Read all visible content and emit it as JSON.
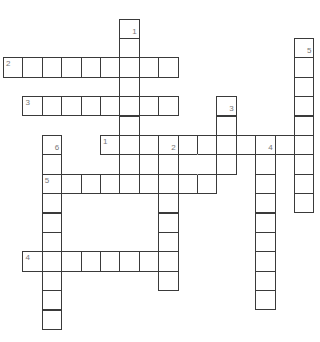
{
  "puzzle": {
    "cell_size": 19.4,
    "origin": {
      "x": 3,
      "y": 18.5
    },
    "colors": {
      "border": "#3a3a3a",
      "background": "#ffffff",
      "number": "#777777"
    },
    "words": [
      {
        "number": "1",
        "direction": "down",
        "col": 6,
        "row": 0,
        "length": 9,
        "label_pos": "br"
      },
      {
        "number": "2",
        "direction": "across",
        "col": 0,
        "row": 2,
        "length": 9,
        "label_pos": "tl"
      },
      {
        "number": "3",
        "direction": "across",
        "col": 1,
        "row": 4,
        "length": 8,
        "label_pos": "tl"
      },
      {
        "number": "3",
        "direction": "down",
        "col": 11,
        "row": 4,
        "length": 4,
        "label_pos": "br"
      },
      {
        "number": "5",
        "direction": "down",
        "col": 15,
        "row": 1,
        "length": 9,
        "label_pos": "br"
      },
      {
        "number": "1",
        "direction": "across",
        "col": 5,
        "row": 6,
        "length": 11,
        "label_pos": "tl"
      },
      {
        "number": "2",
        "direction": "down",
        "col": 8,
        "row": 6,
        "length": 8,
        "label_pos": "br"
      },
      {
        "number": "4",
        "direction": "down",
        "col": 13,
        "row": 6,
        "length": 9,
        "label_pos": "br"
      },
      {
        "number": "6",
        "direction": "down",
        "col": 2,
        "row": 6,
        "length": 10,
        "label_pos": "br"
      },
      {
        "number": "5",
        "direction": "across",
        "col": 2,
        "row": 8,
        "length": 9,
        "label_pos": "tl"
      },
      {
        "number": "4",
        "direction": "across",
        "col": 1,
        "row": 12,
        "length": 8,
        "label_pos": "tl"
      }
    ],
    "extra_cells": [
      {
        "col": 7,
        "row": 7
      },
      {
        "col": 9,
        "row": 7,
        "merge": "right"
      },
      {
        "col": 10,
        "row": 7,
        "merge": "left"
      }
    ]
  }
}
